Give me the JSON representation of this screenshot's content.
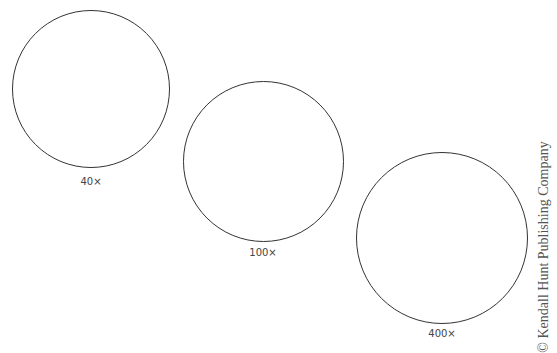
{
  "fields": [
    {
      "id": "40x",
      "label": "40×",
      "cx": 91,
      "cy": 89,
      "r": 79,
      "label_y": 176
    },
    {
      "id": "100x",
      "label": "100×",
      "cx": 263,
      "cy": 162,
      "r": 80,
      "label_y": 247
    },
    {
      "id": "400x",
      "label": "400×",
      "cx": 442,
      "cy": 238,
      "r": 86,
      "label_y": 328
    }
  ],
  "copyright": "© Kendall Hunt Publishing Company",
  "colors": {
    "stroke": "#333333",
    "text": "#444444"
  }
}
